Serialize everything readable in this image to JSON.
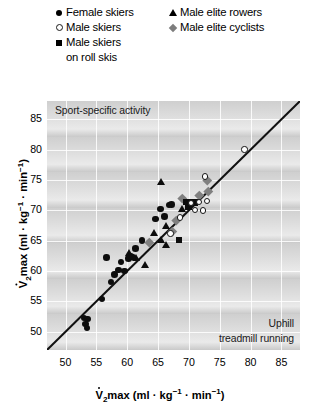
{
  "legend": {
    "items": [
      {
        "label": "Female skiers",
        "marker": "filled-circle",
        "color": "#0d0d0d"
      },
      {
        "label": "Male skiers",
        "marker": "open-circle",
        "color": "#ffffff"
      },
      {
        "label": "Male skiers",
        "label2": "on roll skis",
        "marker": "filled-square",
        "color": "#0d0d0d"
      },
      {
        "label": "Male elite rowers",
        "marker": "filled-triangle",
        "color": "#0d0d0d"
      },
      {
        "label": "Male elite cyclists",
        "marker": "filled-diamond",
        "color": "#808080"
      }
    ]
  },
  "annotations": {
    "sport_specific": "Sport-specific activity",
    "uphill_line1": "Uphill",
    "uphill_line2": "treadmill running"
  },
  "axes": {
    "x_ticks": [
      "50",
      "55",
      "60",
      "65",
      "70",
      "75",
      "80",
      "85"
    ],
    "y_ticks": [
      "50",
      "55",
      "60",
      "65",
      "70",
      "75",
      "80",
      "85"
    ],
    "x_title_prefix": "V",
    "x_title_sub": "2",
    "x_title_rest": "max (ml · kg",
    "x_title_sup1": "-1",
    "x_title_mid": " · min",
    "x_title_sup2": "-1",
    "x_title_end": ")"
  },
  "chart_data": {
    "type": "scatter",
    "title": "",
    "xlabel": "VO2max (ml · kg-1 · min-1) — Uphill treadmill running",
    "ylabel": "VO2max (ml · kg-1 · min-1) — Sport-specific activity",
    "xlim": [
      47,
      88
    ],
    "ylim": [
      47,
      88
    ],
    "xticks": [
      50,
      55,
      60,
      65,
      70,
      75,
      80,
      85
    ],
    "yticks": [
      50,
      55,
      60,
      65,
      70,
      75,
      80,
      85
    ],
    "grid": true,
    "legend_position": "above-plot",
    "reference_line": {
      "type": "identity",
      "slope": 1,
      "intercept": 0,
      "label": "line of identity"
    },
    "series": [
      {
        "name": "Female skiers",
        "marker": "filled-circle",
        "color": "#0d0d0d",
        "points": [
          [
            53.2,
            51.3
          ],
          [
            53.5,
            50.6
          ],
          [
            53.0,
            52.3
          ],
          [
            53.6,
            52.1
          ],
          [
            55.9,
            55.4
          ],
          [
            57.4,
            58.2
          ],
          [
            57.9,
            59.4
          ],
          [
            58.6,
            60.2
          ],
          [
            59.6,
            60.0
          ],
          [
            59.0,
            61.5
          ],
          [
            60.2,
            62.1
          ],
          [
            60.6,
            62.4
          ],
          [
            60.9,
            62.3
          ],
          [
            56.6,
            62.2
          ],
          [
            61.3,
            63.7
          ],
          [
            62.4,
            65.0
          ],
          [
            64.6,
            68.6
          ],
          [
            65.4,
            70.2
          ],
          [
            66.8,
            70.9
          ],
          [
            67.2,
            71.0
          ],
          [
            66.0,
            69.0
          ]
        ]
      },
      {
        "name": "Male skiers",
        "marker": "open-circle",
        "color": "#ffffff",
        "points": [
          [
            79.0,
            80.0
          ],
          [
            72.6,
            75.6
          ],
          [
            71.6,
            71.4
          ],
          [
            72.9,
            71.5
          ],
          [
            70.3,
            71.2
          ],
          [
            71.0,
            70.1
          ],
          [
            72.3,
            70.0
          ],
          [
            68.6,
            68.8
          ],
          [
            67.0,
            66.2
          ]
        ]
      },
      {
        "name": "Male skiers on roll skis",
        "marker": "filled-square",
        "color": "#0d0d0d",
        "points": [
          [
            69.6,
            71.4
          ],
          [
            70.4,
            71.3
          ],
          [
            70.9,
            71.3
          ],
          [
            69.9,
            70.6
          ],
          [
            68.4,
            65.1
          ]
        ]
      },
      {
        "name": "Male elite rowers",
        "marker": "filled-triangle",
        "color": "#0d0d0d",
        "points": [
          [
            65.5,
            74.6
          ],
          [
            68.9,
            70.2
          ],
          [
            66.3,
            67.4
          ],
          [
            64.4,
            66.3
          ],
          [
            65.6,
            65.0
          ],
          [
            66.4,
            64.2
          ],
          [
            60.4,
            63.0
          ],
          [
            61.4,
            62.2
          ],
          [
            62.9,
            61.0
          ]
        ]
      },
      {
        "name": "Male elite cyclists",
        "marker": "filled-diamond",
        "color": "#808080",
        "points": [
          [
            73.0,
            75.0
          ],
          [
            69.0,
            71.9
          ],
          [
            67.9,
            68.4
          ],
          [
            67.3,
            66.6
          ],
          [
            63.5,
            64.8
          ],
          [
            71.6,
            72.4
          ],
          [
            73.1,
            73.1
          ]
        ]
      }
    ]
  }
}
